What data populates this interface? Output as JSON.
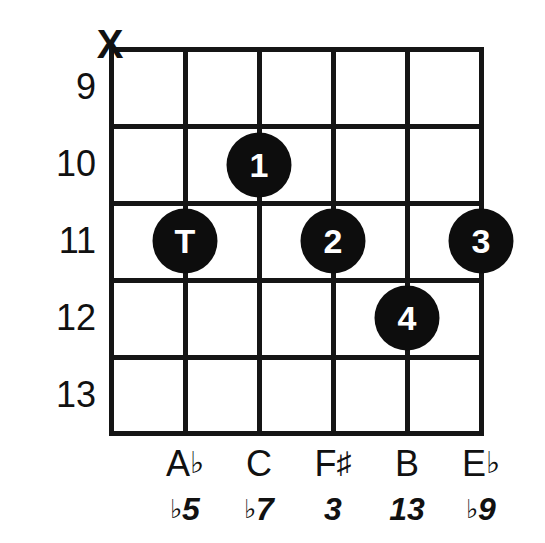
{
  "diagram": {
    "kind": "guitar-chord-diagram",
    "ink_color": "#111111",
    "dot_color": "#0d0d0d",
    "dot_text_color": "#ffffff",
    "background_color": "#ffffff",
    "string_count": 6,
    "fret_count": 5
  },
  "fret_numbers": [
    {
      "label": "9",
      "y": 87
    },
    {
      "label": "10",
      "y": 164
    },
    {
      "label": "11",
      "y": 241
    },
    {
      "label": "12",
      "y": 318
    },
    {
      "label": "13",
      "y": 395
    }
  ],
  "string_x": [
    111,
    185,
    259,
    333,
    407,
    481
  ],
  "fret_y": [
    49,
    126,
    203,
    280,
    357,
    433
  ],
  "muted_strings": [
    {
      "marker": "X",
      "string": 1,
      "x": 110,
      "y": 44
    }
  ],
  "dots": [
    {
      "finger": "1",
      "string": 3,
      "fret": 10,
      "x": 259,
      "y": 165
    },
    {
      "finger": "T",
      "string": 2,
      "fret": 11,
      "x": 185,
      "y": 241
    },
    {
      "finger": "2",
      "string": 4,
      "fret": 11,
      "x": 333,
      "y": 241
    },
    {
      "finger": "3",
      "string": 6,
      "fret": 11,
      "x": 481,
      "y": 241
    },
    {
      "finger": "4",
      "string": 5,
      "fret": 12,
      "x": 407,
      "y": 318
    }
  ],
  "note_labels": [
    {
      "letter": "A",
      "accidental": "♭",
      "x": 185,
      "y": 446
    },
    {
      "letter": "C",
      "accidental": "",
      "x": 259,
      "y": 446
    },
    {
      "letter": "F",
      "accidental": "♯",
      "x": 333,
      "y": 446
    },
    {
      "letter": "B",
      "accidental": "",
      "x": 407,
      "y": 446
    },
    {
      "letter": "E",
      "accidental": "♭",
      "x": 481,
      "y": 446
    }
  ],
  "interval_labels": [
    {
      "accidental": "♭",
      "degree": "5",
      "x": 185,
      "y": 493
    },
    {
      "accidental": "♭",
      "degree": "7",
      "x": 259,
      "y": 493
    },
    {
      "accidental": "",
      "degree": "3",
      "x": 333,
      "y": 493
    },
    {
      "accidental": "",
      "degree": "13",
      "x": 407,
      "y": 493
    },
    {
      "accidental": "♭",
      "degree": "9",
      "x": 481,
      "y": 493
    }
  ]
}
